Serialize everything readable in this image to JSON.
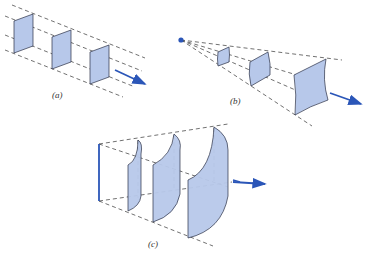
{
  "figure": {
    "panels": [
      {
        "id": "a",
        "label": "(a)",
        "description": "plane wavefronts between parallel rays"
      },
      {
        "id": "b",
        "label": "(b)",
        "description": "spherical wavefronts diverging from a point source"
      },
      {
        "id": "c",
        "label": "(c)",
        "description": "cylindrical wavefronts diverging from a line source"
      }
    ],
    "colors": {
      "wavefront_fill": "#b7c8ea",
      "wavefront_stroke": "#2a2f45",
      "ray_dashed": "#333333",
      "arrow": "#2b56b8",
      "source": "#2b56b8"
    }
  }
}
